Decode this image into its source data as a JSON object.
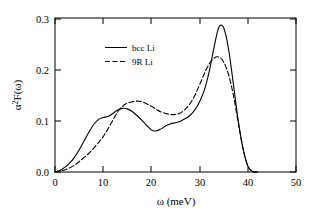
{
  "figure": {
    "background_color": "#ffffff",
    "line_color": "#000000"
  },
  "axis": {
    "x_title": "ω (meV)",
    "y_title_parts": {
      "alpha": "α",
      "exponent": "2",
      "rest": "F(ω)"
    },
    "x_ticks": [
      "0",
      "10",
      "20",
      "30",
      "40",
      "50"
    ],
    "y_ticks": [
      "0.0",
      "0.1",
      "0.2",
      "0.3"
    ]
  },
  "legend": {
    "items": [
      {
        "label": "bcc Li",
        "style": "solid"
      },
      {
        "label": "9R Li",
        "style": "dashed"
      }
    ]
  },
  "chart_data": {
    "type": "line",
    "title": "",
    "xlabel": "ω (meV)",
    "ylabel": "α²F(ω)",
    "xlim": [
      0,
      50
    ],
    "ylim": [
      0.0,
      0.3
    ],
    "xticks": [
      0,
      10,
      20,
      30,
      40,
      50
    ],
    "yticks": [
      0.0,
      0.1,
      0.2,
      0.3
    ],
    "grid": false,
    "legend_position": "upper-left-inside",
    "series": [
      {
        "name": "bcc Li",
        "style": "solid",
        "color": "#000000",
        "x": [
          0,
          1,
          2,
          3,
          4,
          5,
          6,
          7,
          8,
          9,
          10,
          11,
          12,
          13,
          14,
          15,
          16,
          17,
          18,
          19,
          20,
          21,
          22,
          23,
          24,
          25,
          26,
          27,
          28,
          29,
          30,
          31,
          32,
          33,
          34,
          35,
          36,
          37,
          38,
          39,
          40,
          41,
          42
        ],
        "y": [
          0.0,
          0.003,
          0.009,
          0.017,
          0.028,
          0.043,
          0.06,
          0.077,
          0.092,
          0.102,
          0.106,
          0.108,
          0.114,
          0.121,
          0.124,
          0.123,
          0.118,
          0.11,
          0.101,
          0.091,
          0.082,
          0.08,
          0.084,
          0.09,
          0.094,
          0.096,
          0.099,
          0.104,
          0.11,
          0.121,
          0.137,
          0.16,
          0.196,
          0.243,
          0.282,
          0.281,
          0.24,
          0.172,
          0.101,
          0.046,
          0.012,
          0.001,
          0.0
        ]
      },
      {
        "name": "9R Li",
        "style": "dashed",
        "color": "#000000",
        "x": [
          0,
          1,
          2,
          3,
          4,
          5,
          6,
          7,
          8,
          9,
          10,
          11,
          12,
          13,
          14,
          15,
          16,
          17,
          18,
          19,
          20,
          21,
          22,
          23,
          24,
          25,
          26,
          27,
          28,
          29,
          30,
          31,
          32,
          33,
          34,
          35,
          36,
          37,
          38,
          39,
          40,
          41,
          42
        ],
        "y": [
          0.0,
          0.002,
          0.004,
          0.008,
          0.013,
          0.02,
          0.028,
          0.036,
          0.046,
          0.057,
          0.069,
          0.084,
          0.101,
          0.117,
          0.128,
          0.134,
          0.137,
          0.138,
          0.137,
          0.133,
          0.128,
          0.122,
          0.117,
          0.114,
          0.112,
          0.112,
          0.115,
          0.122,
          0.133,
          0.149,
          0.17,
          0.192,
          0.211,
          0.222,
          0.224,
          0.214,
          0.19,
          0.15,
          0.097,
          0.046,
          0.012,
          0.001,
          0.0
        ]
      }
    ],
    "annotations": {
      "bcc_first_peak": {
        "x": 14,
        "y": 0.124
      },
      "bcc_local_min": {
        "x": 21,
        "y": 0.08
      },
      "bcc_main_peak": {
        "x": 34,
        "y": 0.283
      },
      "9r_first_peak": {
        "x": 17.5,
        "y": 0.138
      },
      "9r_local_min": {
        "x": 24.5,
        "y": 0.112
      },
      "9r_main_peak": {
        "x": 34,
        "y": 0.224
      }
    }
  }
}
